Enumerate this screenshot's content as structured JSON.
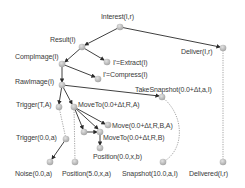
{
  "diagram": {
    "type": "task-decomposition-tree",
    "node_color": "#b8b8b8",
    "edge_color": "#2a2a2a",
    "dotted_edge_color": "#9a9a9a",
    "nodes": [
      {
        "id": "interest",
        "label": "Interest(I,r)",
        "x": 120,
        "y": 27
      },
      {
        "id": "result",
        "label": "Result(I)",
        "x": 82,
        "y": 47
      },
      {
        "id": "deliver",
        "label": "Deliver(I,r)",
        "x": 223,
        "y": 48
      },
      {
        "id": "compimage",
        "label": "CompImage(I)",
        "x": 62,
        "y": 64
      },
      {
        "id": "extract",
        "label": "I'=Extract(I)",
        "x": 107,
        "y": 62
      },
      {
        "id": "compress",
        "label": "I'=Compress(I)",
        "x": 98,
        "y": 79
      },
      {
        "id": "rawimage",
        "label": "RawImage(I)",
        "x": 62,
        "y": 85
      },
      {
        "id": "takesnapshot",
        "label": "TakeSnapshot(0.0+Δt,a,I)",
        "x": 162,
        "y": 97
      },
      {
        "id": "trigger_ta",
        "label": "Trigger(T,A)",
        "x": 59,
        "y": 107
      },
      {
        "id": "moveto_ra",
        "label": "MoveTo(0.0+Δt,R,A)",
        "x": 74,
        "y": 107
      },
      {
        "id": "move_rba",
        "label": "Move(0.0+Δt,R,B,A)",
        "x": 108,
        "y": 125
      },
      {
        "id": "aux",
        "label": "",
        "x": 84,
        "y": 132
      },
      {
        "id": "moveto_rb",
        "label": "MoveTo(0.0+Δt,R,B)",
        "x": 100,
        "y": 132
      },
      {
        "id": "trigger_a",
        "label": "Trigger(0.0,a)",
        "x": 66,
        "y": 139
      },
      {
        "id": "position_b",
        "label": "Position(0.0,x,b)",
        "x": 100,
        "y": 148
      },
      {
        "id": "noise",
        "label": "Noise(0.0,a)",
        "x": 50,
        "y": 162
      },
      {
        "id": "position_a",
        "label": "Position(5.0,x,a)",
        "x": 75,
        "y": 162
      },
      {
        "id": "snapshot",
        "label": "Snapshot(10.0,a,I)",
        "x": 163,
        "y": 162
      },
      {
        "id": "delivered",
        "label": "Delivered(I,r)",
        "x": 223,
        "y": 162
      }
    ],
    "edges": [
      {
        "from": "interest",
        "to": "result",
        "style": "solid"
      },
      {
        "from": "interest",
        "to": "deliver",
        "style": "solid"
      },
      {
        "from": "result",
        "to": "compimage",
        "style": "solid"
      },
      {
        "from": "result",
        "to": "extract",
        "style": "solid"
      },
      {
        "from": "compimage",
        "to": "compress",
        "style": "solid"
      },
      {
        "from": "compimage",
        "to": "rawimage",
        "style": "solid"
      },
      {
        "from": "rawimage",
        "to": "takesnapshot",
        "style": "solid"
      },
      {
        "from": "rawimage",
        "to": "trigger_ta",
        "style": "solid"
      },
      {
        "from": "rawimage",
        "to": "moveto_ra",
        "style": "solid"
      },
      {
        "from": "moveto_ra",
        "to": "move_rba",
        "style": "solid"
      },
      {
        "from": "moveto_ra",
        "to": "moveto_rb",
        "style": "solid"
      },
      {
        "from": "moveto_ra",
        "to": "aux",
        "style": "solid"
      },
      {
        "from": "aux",
        "to": "moveto_rb",
        "style": "solid"
      },
      {
        "from": "moveto_rb",
        "to": "position_b",
        "style": "solid"
      },
      {
        "from": "trigger_a",
        "to": "noise",
        "style": "solid"
      },
      {
        "from": "trigger_ta",
        "to": "trigger_a",
        "style": "dotted"
      },
      {
        "from": "moveto_ra",
        "to": "position_a",
        "style": "dotted"
      },
      {
        "from": "takesnapshot",
        "to": "snapshot",
        "style": "dotted"
      },
      {
        "from": "deliver",
        "to": "delivered",
        "style": "dotted"
      }
    ]
  },
  "labels": {
    "interest": "Interest(I,r)",
    "result": "Result(I)",
    "deliver": "Deliver(I,r)",
    "compimage": "CompImage(I)",
    "extract": "I'=Extract(I)",
    "compress": "I'=Compress(I)",
    "rawimage": "RawImage(I)",
    "takesnapshot": "TakeSnapshot(0.0+Δt,a,I)",
    "trigger_ta": "Trigger(T,A)",
    "moveto_ra": "MoveTo(0.0+Δt,R,A)",
    "move_rba": "Move(0.0+Δt,R,B,A)",
    "moveto_rb": "MoveTo(0.0+Δt,R,B)",
    "trigger_a": "Trigger(0.0,a)",
    "position_b": "Position(0.0,x,b)",
    "noise": "Noise(0.0,a)",
    "position_a": "Position(5.0,x,a)",
    "snapshot": "Snapshot(10.0,a,I)",
    "delivered": "Delivered(I,r)"
  }
}
